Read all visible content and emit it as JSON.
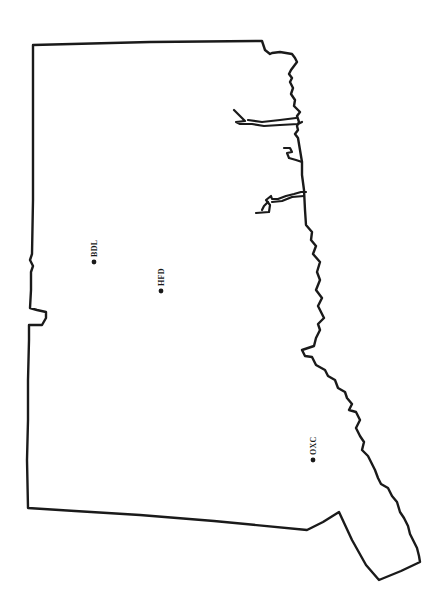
{
  "map": {
    "orientation": "rotated 90° (north to the right)",
    "background": "#ffffff",
    "line_color": "#1a1a1a",
    "stations": [
      {
        "id": "BDL",
        "label": "BDL",
        "x": 94,
        "y": 262
      },
      {
        "id": "HFD",
        "label": "HFD",
        "x": 161,
        "y": 291
      },
      {
        "id": "OXC",
        "label": "OXC",
        "x": 313,
        "y": 460
      }
    ]
  }
}
